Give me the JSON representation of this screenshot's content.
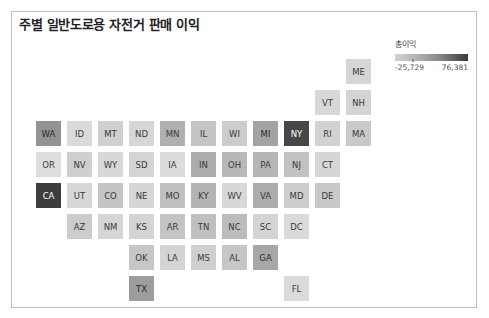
{
  "title": "주별 일반도로용 자전거 판매 이익",
  "legend": {
    "title": "총이익",
    "min_label": "-25,729",
    "max_label": "76,381",
    "min_value": -25729,
    "max_value": 76381
  },
  "grid": {
    "origin_x": 36,
    "origin_y": 59,
    "step": 31,
    "tile_size": 25
  },
  "tiles": [
    {
      "state": "ME",
      "row": 0,
      "col": 10,
      "color": "#d6d6d6",
      "text_color": "#3a3a3a"
    },
    {
      "state": "VT",
      "row": 1,
      "col": 9,
      "color": "#d8d8d8",
      "text_color": "#3a3a3a"
    },
    {
      "state": "NH",
      "row": 1,
      "col": 10,
      "color": "#d4d4d4",
      "text_color": "#3a3a3a"
    },
    {
      "state": "WA",
      "row": 2,
      "col": 0,
      "color": "#939393",
      "text_color": "#2a2a2a"
    },
    {
      "state": "ID",
      "row": 2,
      "col": 1,
      "color": "#dadada",
      "text_color": "#3a3a3a"
    },
    {
      "state": "MT",
      "row": 2,
      "col": 2,
      "color": "#d0d0d0",
      "text_color": "#3a3a3a"
    },
    {
      "state": "ND",
      "row": 2,
      "col": 3,
      "color": "#d6d6d6",
      "text_color": "#3a3a3a"
    },
    {
      "state": "MN",
      "row": 2,
      "col": 4,
      "color": "#b0b0b0",
      "text_color": "#3a3a3a"
    },
    {
      "state": "IL",
      "row": 2,
      "col": 5,
      "color": "#c4c4c4",
      "text_color": "#3a3a3a"
    },
    {
      "state": "WI",
      "row": 2,
      "col": 6,
      "color": "#cccccc",
      "text_color": "#3a3a3a"
    },
    {
      "state": "MI",
      "row": 2,
      "col": 7,
      "color": "#a3a3a3",
      "text_color": "#2a2a2a"
    },
    {
      "state": "NY",
      "row": 2,
      "col": 8,
      "color": "#474747",
      "text_color": "#ffffff"
    },
    {
      "state": "RI",
      "row": 2,
      "col": 9,
      "color": "#d2d2d2",
      "text_color": "#3a3a3a"
    },
    {
      "state": "MA",
      "row": 2,
      "col": 10,
      "color": "#c9c9c9",
      "text_color": "#3a3a3a"
    },
    {
      "state": "OR",
      "row": 3,
      "col": 0,
      "color": "#dedede",
      "text_color": "#3a3a3a"
    },
    {
      "state": "NV",
      "row": 3,
      "col": 1,
      "color": "#cfcfcf",
      "text_color": "#3a3a3a"
    },
    {
      "state": "WY",
      "row": 3,
      "col": 2,
      "color": "#d8d8d8",
      "text_color": "#3a3a3a"
    },
    {
      "state": "SD",
      "row": 3,
      "col": 3,
      "color": "#d4d4d4",
      "text_color": "#3a3a3a"
    },
    {
      "state": "IA",
      "row": 3,
      "col": 4,
      "color": "#dcdcdc",
      "text_color": "#3a3a3a"
    },
    {
      "state": "IN",
      "row": 3,
      "col": 5,
      "color": "#acacac",
      "text_color": "#3a3a3a"
    },
    {
      "state": "OH",
      "row": 3,
      "col": 6,
      "color": "#b8b8b8",
      "text_color": "#3a3a3a"
    },
    {
      "state": "PA",
      "row": 3,
      "col": 7,
      "color": "#b6b6b6",
      "text_color": "#3a3a3a"
    },
    {
      "state": "NJ",
      "row": 3,
      "col": 8,
      "color": "#c2c2c2",
      "text_color": "#3a3a3a"
    },
    {
      "state": "CT",
      "row": 3,
      "col": 9,
      "color": "#d6d6d6",
      "text_color": "#3a3a3a"
    },
    {
      "state": "CA",
      "row": 4,
      "col": 0,
      "color": "#3d3d3d",
      "text_color": "#ffffff"
    },
    {
      "state": "UT",
      "row": 4,
      "col": 1,
      "color": "#d8d8d8",
      "text_color": "#3a3a3a"
    },
    {
      "state": "CO",
      "row": 4,
      "col": 2,
      "color": "#c4c4c4",
      "text_color": "#3a3a3a"
    },
    {
      "state": "NE",
      "row": 4,
      "col": 3,
      "color": "#d6d6d6",
      "text_color": "#3a3a3a"
    },
    {
      "state": "MO",
      "row": 4,
      "col": 4,
      "color": "#c0c0c0",
      "text_color": "#3a3a3a"
    },
    {
      "state": "KY",
      "row": 4,
      "col": 5,
      "color": "#b4b4b4",
      "text_color": "#3a3a3a"
    },
    {
      "state": "WV",
      "row": 4,
      "col": 6,
      "color": "#d8d8d8",
      "text_color": "#3a3a3a"
    },
    {
      "state": "VA",
      "row": 4,
      "col": 7,
      "color": "#acacac",
      "text_color": "#3a3a3a"
    },
    {
      "state": "MD",
      "row": 4,
      "col": 8,
      "color": "#cdcdcd",
      "text_color": "#3a3a3a"
    },
    {
      "state": "DE",
      "row": 4,
      "col": 9,
      "color": "#c8c8c8",
      "text_color": "#3a3a3a"
    },
    {
      "state": "AZ",
      "row": 5,
      "col": 1,
      "color": "#cccccc",
      "text_color": "#3a3a3a"
    },
    {
      "state": "NM",
      "row": 5,
      "col": 2,
      "color": "#d6d6d6",
      "text_color": "#3a3a3a"
    },
    {
      "state": "KS",
      "row": 5,
      "col": 3,
      "color": "#d4d4d4",
      "text_color": "#3a3a3a"
    },
    {
      "state": "AR",
      "row": 5,
      "col": 4,
      "color": "#c4c4c4",
      "text_color": "#3a3a3a"
    },
    {
      "state": "TN",
      "row": 5,
      "col": 5,
      "color": "#c0c0c0",
      "text_color": "#3a3a3a"
    },
    {
      "state": "NC",
      "row": 5,
      "col": 6,
      "color": "#bcbcbc",
      "text_color": "#3a3a3a"
    },
    {
      "state": "SC",
      "row": 5,
      "col": 7,
      "color": "#d4d4d4",
      "text_color": "#3a3a3a"
    },
    {
      "state": "DC",
      "row": 5,
      "col": 8,
      "color": "#dadada",
      "text_color": "#3a3a3a"
    },
    {
      "state": "OK",
      "row": 6,
      "col": 3,
      "color": "#c6c6c6",
      "text_color": "#3a3a3a"
    },
    {
      "state": "LA",
      "row": 6,
      "col": 4,
      "color": "#d4d4d4",
      "text_color": "#3a3a3a"
    },
    {
      "state": "MS",
      "row": 6,
      "col": 5,
      "color": "#cfcfcf",
      "text_color": "#3a3a3a"
    },
    {
      "state": "AL",
      "row": 6,
      "col": 6,
      "color": "#c6c6c6",
      "text_color": "#3a3a3a"
    },
    {
      "state": "GA",
      "row": 6,
      "col": 7,
      "color": "#a7a7a7",
      "text_color": "#2a2a2a"
    },
    {
      "state": "TX",
      "row": 7,
      "col": 3,
      "color": "#9d9d9d",
      "text_color": "#2a2a2a"
    },
    {
      "state": "FL",
      "row": 7,
      "col": 8,
      "color": "#dadada",
      "text_color": "#3a3a3a"
    }
  ]
}
